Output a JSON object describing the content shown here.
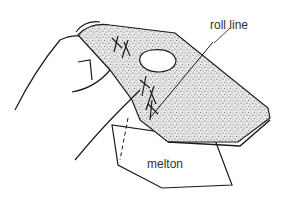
{
  "figure": {
    "labels": {
      "roll_line": "roll line",
      "melton": "melton"
    },
    "colors": {
      "ink": "#1a1a1a",
      "paper": "#ffffff",
      "fabric_speckle": "#555555"
    }
  }
}
